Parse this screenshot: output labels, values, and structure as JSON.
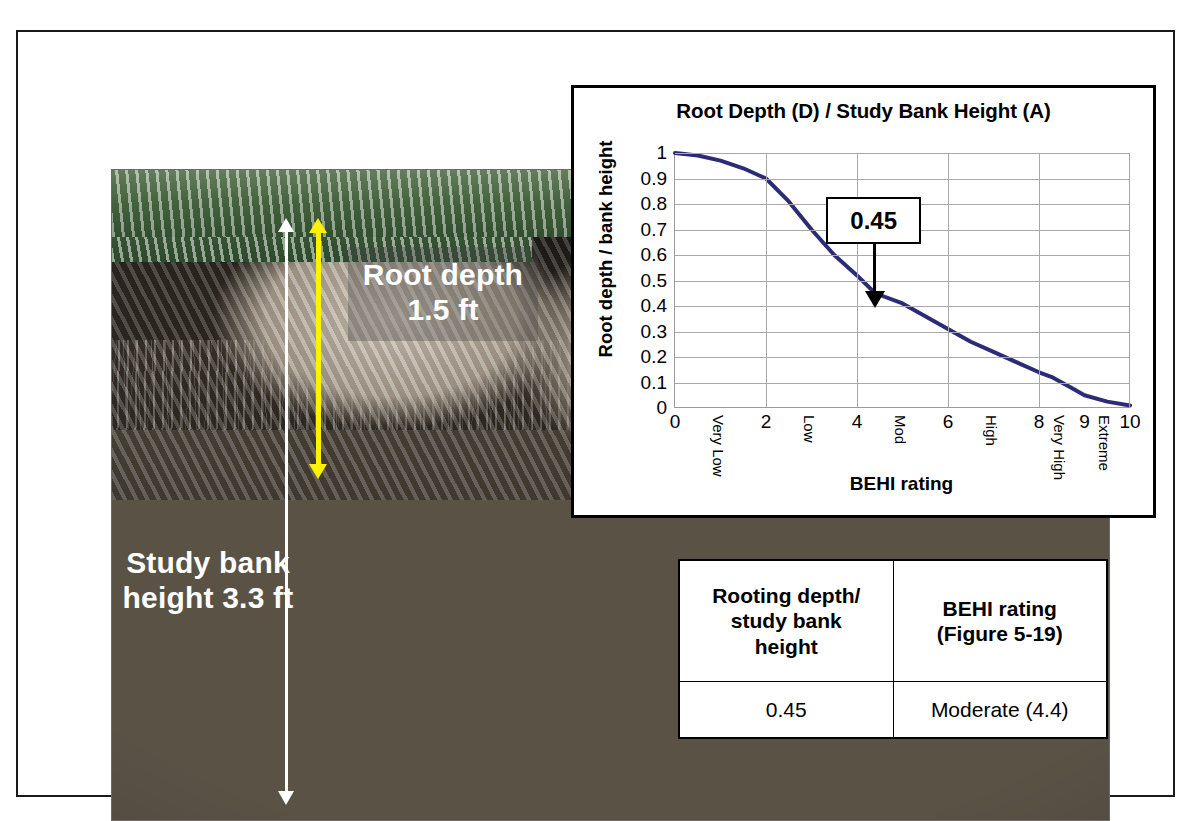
{
  "figure": {
    "photo": {
      "annotations": [
        {
          "id": "root-depth",
          "label": "Root\ndepth\n1.5 ft",
          "text": "Root depth 1.5 ft",
          "value": "1.5 ft",
          "arrow_color": "#fff200"
        },
        {
          "id": "bank-height",
          "label": "Study\nbank\nheight\n3.3 ft",
          "text": "Study bank height 3.3 ft",
          "value": "3.3 ft",
          "arrow_color": "#ffffff"
        }
      ]
    },
    "chart_panel": {
      "callout": {
        "value": "0.45"
      }
    },
    "results_table": {
      "headers": [
        "Rooting depth/ study bank height",
        "BEHI rating (Figure 5-19)"
      ],
      "header_lines": [
        [
          "Rooting depth/",
          "study bank",
          "height"
        ],
        [
          "BEHI rating",
          "(Figure 5-19)"
        ]
      ],
      "rows": [
        [
          "0.45",
          "Moderate (4.4)"
        ]
      ]
    }
  },
  "chart_data": {
    "type": "line",
    "title": "Root Depth (D) / Study Bank Height (A)",
    "xlabel": "BEHI rating",
    "ylabel": "Root depth / bank height",
    "xlim": [
      0,
      10
    ],
    "ylim": [
      0,
      1
    ],
    "grid": true,
    "legend": "none",
    "line_color": "#2d2b78",
    "grid_color": "#a8a8a8",
    "y_ticks": [
      "1",
      "0.9",
      "0.8",
      "0.7",
      "0.6",
      "0.5",
      "0.4",
      "0.3",
      "0.2",
      "0.1",
      "0"
    ],
    "y_tick_values": [
      1,
      0.9,
      0.8,
      0.7,
      0.6,
      0.5,
      0.4,
      0.3,
      0.2,
      0.1,
      0
    ],
    "x_ticks_numeric": [
      {
        "label": "0",
        "value": 0
      },
      {
        "label": "2",
        "value": 2
      },
      {
        "label": "4",
        "value": 4
      },
      {
        "label": "6",
        "value": 6
      },
      {
        "label": "8",
        "value": 8
      },
      {
        "label": "9",
        "value": 9
      },
      {
        "label": "10",
        "value": 10
      }
    ],
    "x_ticks_category": [
      {
        "label": "Very Low",
        "value": 1.0
      },
      {
        "label": "Low",
        "value": 3.0
      },
      {
        "label": "Mod",
        "value": 5.0
      },
      {
        "label": "High",
        "value": 7.0
      },
      {
        "label": "Very High",
        "value": 8.5
      },
      {
        "label": "Extreme",
        "value": 9.5
      }
    ],
    "x_gridlines": [
      2,
      4,
      6,
      8
    ],
    "series": [
      {
        "name": "Root depth / bank height",
        "x": [
          0,
          0.5,
          1.0,
          1.5,
          2.0,
          2.5,
          3.0,
          3.5,
          4.0,
          4.4,
          5.0,
          5.5,
          6.0,
          6.5,
          7.0,
          7.5,
          8.0,
          8.3,
          8.7,
          9.0,
          9.5,
          10.0
        ],
        "values": [
          1.0,
          0.99,
          0.97,
          0.94,
          0.9,
          0.81,
          0.7,
          0.6,
          0.52,
          0.45,
          0.41,
          0.36,
          0.31,
          0.26,
          0.22,
          0.18,
          0.14,
          0.12,
          0.08,
          0.05,
          0.025,
          0.01
        ]
      }
    ],
    "annotations": [
      {
        "text": "0.45",
        "x": 4.4,
        "y": 0.45,
        "type": "callout-box-with-down-arrow"
      }
    ]
  }
}
